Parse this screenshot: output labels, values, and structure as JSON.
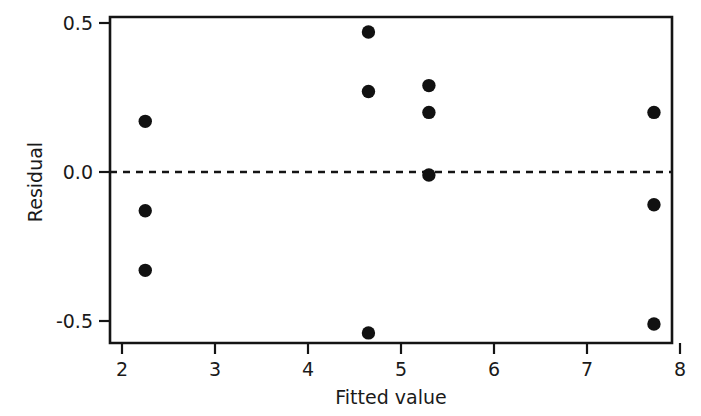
{
  "chart_data": {
    "type": "scatter",
    "title": "",
    "xlabel": "Fitted value",
    "ylabel": "Residual",
    "xlim": [
      1.88,
      8.0
    ],
    "ylim": [
      -0.58,
      0.52
    ],
    "xticks": [
      2,
      3,
      4,
      5,
      6,
      7,
      8
    ],
    "xtick_labels": [
      "2",
      "3",
      "4",
      "5",
      "6",
      "7",
      "8"
    ],
    "yticks": [
      0.5,
      0.0,
      -0.5
    ],
    "ytick_labels": [
      "0.5",
      "0.0",
      "-0.5"
    ],
    "grid": false,
    "legend": null,
    "reference_line": {
      "orientation": "horizontal",
      "value": 0.0,
      "style": "dashed",
      "color": "#141414"
    },
    "marker": {
      "shape": "circle",
      "color": "#111111",
      "size": 7
    },
    "points": [
      {
        "x": 2.25,
        "y": 0.17
      },
      {
        "x": 2.25,
        "y": -0.13
      },
      {
        "x": 2.25,
        "y": -0.33
      },
      {
        "x": 4.65,
        "y": 0.47
      },
      {
        "x": 4.65,
        "y": 0.27
      },
      {
        "x": 4.65,
        "y": -0.54
      },
      {
        "x": 5.3,
        "y": 0.29
      },
      {
        "x": 5.3,
        "y": 0.2
      },
      {
        "x": 5.3,
        "y": -0.01
      },
      {
        "x": 7.72,
        "y": 0.2
      },
      {
        "x": 7.72,
        "y": -0.11
      },
      {
        "x": 7.72,
        "y": -0.51
      }
    ]
  }
}
